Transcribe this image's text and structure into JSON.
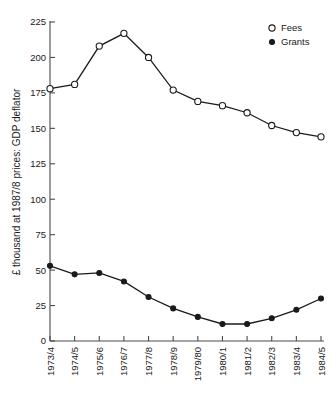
{
  "chart_data": {
    "type": "line",
    "title": "",
    "xlabel": "",
    "ylabel": "£ thousand at 1987/8 prices: GDP deflator",
    "categories": [
      "1973/4",
      "1974/5",
      "1975/6",
      "1976/7",
      "1977/8",
      "1978/9",
      "1979/80",
      "1980/1",
      "1981/2",
      "1982/3",
      "1983/4",
      "1984/5"
    ],
    "ylim": [
      0,
      225
    ],
    "yticks": [
      0,
      25,
      50,
      75,
      100,
      125,
      150,
      175,
      200,
      225
    ],
    "ytick_labels": [
      "0",
      "25",
      "50",
      "75",
      "100",
      "125",
      "150",
      "175",
      "200",
      "225"
    ],
    "grid": false,
    "legend_position": "top-right",
    "series": [
      {
        "name": "Fees",
        "marker": "open-circle",
        "color": "#1a1a1a",
        "values": [
          178,
          181,
          208,
          217,
          200,
          177,
          169,
          166,
          161,
          152,
          147,
          144
        ]
      },
      {
        "name": "Grants",
        "marker": "filled-circle",
        "color": "#1a1a1a",
        "values": [
          53,
          47,
          48,
          42,
          31,
          23,
          17,
          12,
          12,
          16,
          22,
          30
        ]
      }
    ]
  },
  "legend": {
    "items": [
      {
        "label": "Fees",
        "marker": "open-circle"
      },
      {
        "label": "Grants",
        "marker": "filled-circle"
      }
    ]
  }
}
